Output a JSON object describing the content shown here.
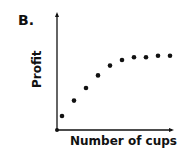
{
  "panel_label": "B.",
  "chart_data": {
    "type": "scatter",
    "title": "",
    "xlabel": "Number of cups",
    "ylabel": "Profit",
    "grid": false,
    "legend": null,
    "x": [
      1,
      2,
      3,
      4,
      5,
      6,
      7,
      8,
      9,
      10
    ],
    "y": [
      1.0,
      2.1,
      3.0,
      3.9,
      4.6,
      5.0,
      5.2,
      5.2,
      5.3,
      5.3
    ],
    "note": "Qualitative sketch; no tick labels. Profit rises steeply then plateaus."
  }
}
